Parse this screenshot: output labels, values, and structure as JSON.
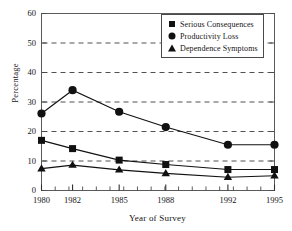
{
  "chart_data": {
    "type": "line",
    "title": "",
    "xlabel": "Year of Survey",
    "ylabel": "Percentage",
    "x": [
      1980,
      1982,
      1985,
      1988,
      1992,
      1995
    ],
    "categories": [
      "1980",
      "1982",
      "1985",
      "1988",
      "1992",
      "1995"
    ],
    "xtick_labels": [
      "1980",
      "1982",
      "1985",
      "1988",
      "1992",
      "1995"
    ],
    "ytick_labels": [
      "0",
      "10",
      "20",
      "30",
      "40",
      "50",
      "60"
    ],
    "ytick_values": [
      0,
      10,
      20,
      30,
      40,
      50,
      60
    ],
    "ylim": [
      0,
      60
    ],
    "grid": "horizontal-dashed",
    "legend_position": "top-right",
    "series": [
      {
        "name": "Serious Consequences",
        "marker": "square",
        "color": "#111111",
        "values": [
          17.0,
          14.2,
          10.3,
          8.8,
          7.1,
          7.1
        ]
      },
      {
        "name": "Productivity Loss",
        "marker": "circle",
        "color": "#111111",
        "values": [
          26.1,
          34.0,
          26.7,
          21.5,
          15.5,
          15.5
        ]
      },
      {
        "name": "Dependence Symptoms",
        "marker": "triangle",
        "color": "#111111",
        "values": [
          7.4,
          8.6,
          7.0,
          5.8,
          4.5,
          5.0
        ]
      }
    ]
  },
  "legend": {
    "items": [
      {
        "label": "Serious Consequences",
        "marker": "square"
      },
      {
        "label": "Productivity Loss",
        "marker": "circle"
      },
      {
        "label": "Dependence Symptoms",
        "marker": "triangle"
      }
    ]
  },
  "axes": {
    "y_title": "Percentage",
    "x_title": "Year of Survey"
  }
}
